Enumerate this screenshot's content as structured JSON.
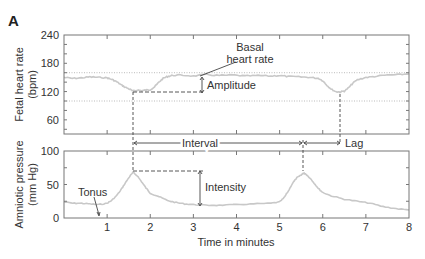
{
  "panel_label": "A",
  "colors": {
    "trace": "#c8c8c8",
    "frame": "#777777",
    "annotation": "#444444",
    "reference_dotted": "#bbbbbb",
    "text": "#333333"
  },
  "chart_data": [
    {
      "type": "line",
      "title": "Fetal heart rate",
      "ylabel": "Fetal heart rate (bpm)",
      "ylabel_lines": [
        "Fetal heart rate",
        "(bpm)"
      ],
      "xlabel": "",
      "ylim": [
        30,
        240
      ],
      "xlim": [
        0,
        8
      ],
      "yticks": [
        60,
        120,
        180,
        240
      ],
      "reference_lines": [
        100,
        160
      ],
      "grid": false,
      "x": [
        0.0,
        0.2,
        0.4,
        0.6,
        0.8,
        1.0,
        1.1,
        1.2,
        1.3,
        1.4,
        1.5,
        1.6,
        1.7,
        1.8,
        1.9,
        2.0,
        2.1,
        2.2,
        2.3,
        2.4,
        2.5,
        2.7,
        3.0,
        3.3,
        3.6,
        3.9,
        4.2,
        4.5,
        4.8,
        5.0,
        5.2,
        5.5,
        5.7,
        5.9,
        6.0,
        6.1,
        6.2,
        6.3,
        6.4,
        6.5,
        6.6,
        6.7,
        6.8,
        7.0,
        7.2,
        7.5,
        7.8,
        8.0
      ],
      "values": [
        150,
        148,
        149,
        151,
        150,
        149,
        146,
        142,
        136,
        130,
        126,
        121,
        123,
        122,
        123,
        124,
        130,
        140,
        148,
        152,
        154,
        155,
        153,
        156,
        154,
        155,
        153,
        154,
        153,
        154,
        152,
        151,
        150,
        148,
        143,
        133,
        125,
        120,
        119,
        121,
        128,
        138,
        145,
        150,
        152,
        155,
        156,
        158
      ]
    },
    {
      "type": "line",
      "title": "Amniotic pressure",
      "ylabel": "Amniotic pressure (mm Hg)",
      "ylabel_lines": [
        "Amniotic pressure",
        "(mm Hg)"
      ],
      "xlabel": "Time in minutes",
      "ylim": [
        0,
        100
      ],
      "xlim": [
        0,
        8
      ],
      "yticks": [
        0,
        50,
        100
      ],
      "xticks": [
        1,
        2,
        3,
        4,
        5,
        6,
        7,
        8
      ],
      "grid": false,
      "x": [
        0.0,
        0.2,
        0.4,
        0.6,
        0.8,
        1.0,
        1.1,
        1.2,
        1.3,
        1.4,
        1.5,
        1.6,
        1.7,
        1.8,
        1.9,
        2.0,
        2.2,
        2.4,
        2.6,
        2.8,
        3.0,
        3.3,
        3.6,
        4.0,
        4.4,
        4.8,
        5.0,
        5.1,
        5.2,
        5.3,
        5.4,
        5.5,
        5.55,
        5.6,
        5.7,
        5.8,
        5.9,
        6.0,
        6.2,
        6.5,
        6.8,
        7.1,
        7.4,
        7.7,
        8.0
      ],
      "values": [
        24,
        22,
        22,
        21,
        20,
        22,
        26,
        32,
        40,
        50,
        60,
        68,
        63,
        54,
        45,
        37,
        32,
        26,
        23,
        21,
        20,
        19,
        19,
        20,
        21,
        22,
        24,
        30,
        40,
        52,
        60,
        64,
        67,
        66,
        60,
        52,
        44,
        38,
        33,
        28,
        25,
        22,
        17,
        14,
        12
      ]
    }
  ],
  "annotations": {
    "basal_heart_rate": [
      "Basal",
      "heart rate"
    ],
    "amplitude": "Amplitude",
    "interval": "Interval",
    "lag": "Lag",
    "tonus": "Tonus",
    "intensity": "Intensity"
  }
}
